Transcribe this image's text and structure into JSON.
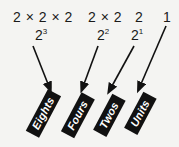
{
  "figure": {
    "background_color": "#f4f4f2",
    "ink_color": "#111111",
    "chip_text_color": "#ffffff"
  },
  "expressions": [
    {
      "id": "eights",
      "expanded": "2 × 2 × 2",
      "base": "2",
      "exponent": "3",
      "x": 13,
      "y": 10
    },
    {
      "id": "fours",
      "expanded": "2 × 2",
      "base": "2",
      "exponent": "2",
      "x": 88,
      "y": 10
    },
    {
      "id": "twos",
      "expanded": "2",
      "base": "2",
      "exponent": "1",
      "x": 135,
      "y": 10
    },
    {
      "id": "units",
      "expanded": "1",
      "base": "",
      "exponent": "",
      "x": 163,
      "y": 10
    }
  ],
  "chips": [
    {
      "id": "eights",
      "label": "Eights",
      "x": 43,
      "y": 113,
      "rotation": -62
    },
    {
      "id": "fours",
      "label": "Fours",
      "x": 78,
      "y": 115,
      "rotation": -62
    },
    {
      "id": "twos",
      "label": "Twos",
      "x": 109,
      "y": 115,
      "rotation": -62
    },
    {
      "id": "units",
      "label": "Units",
      "x": 140,
      "y": 113,
      "rotation": -62
    }
  ],
  "arrows": [
    {
      "id": "arrow-eights",
      "from_x": 33,
      "from_y": 46,
      "to_x": 48,
      "to_y": 84
    },
    {
      "id": "arrow-fours",
      "from_x": 98,
      "from_y": 46,
      "to_x": 84,
      "to_y": 84
    },
    {
      "id": "arrow-twos",
      "from_x": 134,
      "from_y": 46,
      "to_x": 112,
      "to_y": 86
    },
    {
      "id": "arrow-units",
      "from_x": 166,
      "from_y": 26,
      "to_x": 141,
      "to_y": 84
    }
  ]
}
